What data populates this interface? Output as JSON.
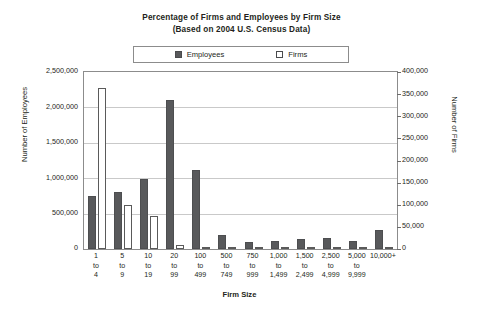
{
  "title": {
    "line1": "Percentage of Firms and Employees by Firm Size",
    "line2": "(Based on 2004 U.S. Census Data)"
  },
  "legend": {
    "employees_label": "Employees",
    "firms_label": "Firms",
    "employees_color": "#58595b",
    "firms_color": "#ffffff"
  },
  "axes": {
    "left_title": "Number of Employees",
    "right_title": "Number of Firms",
    "x_title": "Firm Size",
    "left_ticks": [
      "2,500,000",
      "2,000,000",
      "1,500,000",
      "1,000,000",
      "500,000",
      "0"
    ],
    "right_ticks": [
      "400,000",
      "350,000",
      "300,000",
      "250,000",
      "200,000",
      "150,000",
      "100,000",
      "50,000",
      "0"
    ]
  },
  "chart_data": {
    "type": "bar",
    "title": "Percentage of Firms and Employees by Firm Size (Based on 2004 U.S. Census Data)",
    "xlabel": "Firm Size",
    "ylabel": "Number of Employees",
    "y2label": "Number of Firms",
    "ylim": [
      0,
      2500000
    ],
    "y2lim": [
      0,
      400000
    ],
    "grid": true,
    "legend_position": "top-center",
    "categories": [
      "1 to 4",
      "5 to 9",
      "10 to 19",
      "20 to 99",
      "100 to 499",
      "500 to 749",
      "750 to 999",
      "1,000 to 1,499",
      "1,500 to 2,499",
      "2,500 to 4,999",
      "5,000 to 9,999",
      "10,000+"
    ],
    "category_lines": [
      [
        "1",
        "to",
        "4"
      ],
      [
        "5",
        "to",
        "9"
      ],
      [
        "10",
        "to",
        "19"
      ],
      [
        "20",
        "to",
        "99"
      ],
      [
        "100",
        "to",
        "499"
      ],
      [
        "500",
        "to",
        "749"
      ],
      [
        "750",
        "to",
        "999"
      ],
      [
        "1,000",
        "to",
        "1,499"
      ],
      [
        "1,500",
        "to",
        "2,499"
      ],
      [
        "2,500",
        "to",
        "4,999"
      ],
      [
        "5,000",
        "to",
        "9,999"
      ],
      [
        "10,000+",
        "",
        ""
      ]
    ],
    "series": [
      {
        "name": "Employees",
        "axis": "left",
        "color": "#58595b",
        "values": [
          750000,
          810000,
          990000,
          2110000,
          1120000,
          195000,
          105000,
          120000,
          135000,
          150000,
          110000,
          265000
        ]
      },
      {
        "name": "Firms",
        "axis": "right",
        "color": "#ffffff",
        "values": [
          364000,
          99000,
          74000,
          8500,
          1700,
          480,
          290,
          250,
          190,
          120,
          60,
          90
        ]
      }
    ]
  }
}
